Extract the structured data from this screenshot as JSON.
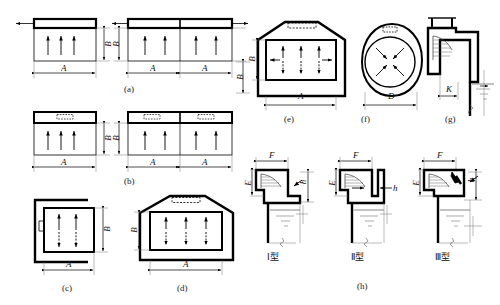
{
  "figure": {
    "title_visible": false,
    "background": "#ffffff",
    "line_color": "#000000",
    "thin_line_color": "#555555",
    "water_line_color": "#555555"
  },
  "panels": [
    {
      "id": "a",
      "caption": "(a)",
      "dims": [
        {
          "label": "A",
          "orientation": "horizontal"
        },
        {
          "label": "B",
          "orientation": "vertical"
        },
        {
          "label": "A",
          "orientation": "horizontal"
        },
        {
          "label": "A",
          "orientation": "horizontal"
        },
        {
          "label": "B",
          "orientation": "vertical"
        },
        {
          "label": "B",
          "orientation": "vertical"
        }
      ]
    },
    {
      "id": "b",
      "caption": "(b)",
      "dims": [
        {
          "label": "A",
          "orientation": "horizontal"
        },
        {
          "label": "B",
          "orientation": "vertical"
        },
        {
          "label": "A",
          "orientation": "horizontal"
        },
        {
          "label": "A",
          "orientation": "horizontal"
        },
        {
          "label": "B",
          "orientation": "vertical"
        }
      ]
    },
    {
      "id": "c",
      "caption": "(c)",
      "dims": [
        {
          "label": "A",
          "orientation": "horizontal"
        },
        {
          "label": "B",
          "orientation": "vertical"
        }
      ]
    },
    {
      "id": "d",
      "caption": "(d)",
      "dims": [
        {
          "label": "A",
          "orientation": "horizontal"
        },
        {
          "label": "B",
          "orientation": "vertical"
        }
      ]
    },
    {
      "id": "e",
      "caption": "(e)",
      "dims": [
        {
          "label": "A",
          "orientation": "horizontal"
        },
        {
          "label": "B",
          "orientation": "vertical"
        }
      ]
    },
    {
      "id": "f",
      "caption": "(f)",
      "dims": [
        {
          "label": "D",
          "orientation": "horizontal"
        }
      ]
    },
    {
      "id": "g",
      "caption": "(g)",
      "dims": [
        {
          "label": "K",
          "orientation": "horizontal"
        }
      ]
    },
    {
      "id": "h",
      "caption": "(h)",
      "dims": [
        {
          "label": "F",
          "orientation": "horizontal"
        },
        {
          "label": "E",
          "orientation": "vertical"
        },
        {
          "label": "h",
          "orientation": "vertical"
        },
        {
          "label": "F",
          "orientation": "horizontal"
        },
        {
          "label": "E",
          "orientation": "vertical"
        },
        {
          "label": "h",
          "orientation": "horizontal"
        },
        {
          "label": "F",
          "orientation": "horizontal"
        },
        {
          "label": "E",
          "orientation": "vertical"
        },
        {
          "label": "h",
          "orientation": "vertical"
        }
      ],
      "types": [
        {
          "label": "Ⅰ型"
        },
        {
          "label": "Ⅱ型"
        },
        {
          "label": "Ⅲ型"
        }
      ]
    }
  ],
  "labels": {
    "cap_a": "(a)",
    "cap_b": "(b)",
    "cap_c": "(c)",
    "cap_d": "(d)",
    "cap_e": "(e)",
    "cap_f": "(f)",
    "cap_g": "(g)",
    "cap_h": "(h)",
    "A": "A",
    "B": "B",
    "D": "D",
    "K": "K",
    "F": "F",
    "E": "E",
    "h": "h",
    "type1": "Ⅰ型",
    "type2": "Ⅱ型",
    "type3": "Ⅲ型"
  }
}
